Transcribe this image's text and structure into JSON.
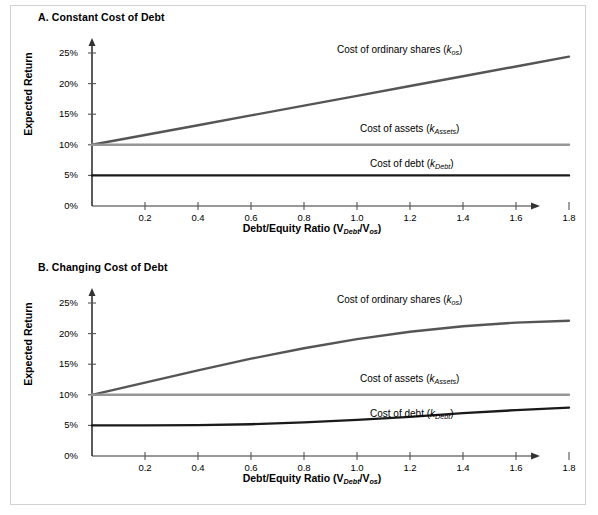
{
  "figure": {
    "background_color": "#ffffff",
    "border_color": "#d2d2d2",
    "width": 598,
    "height": 515
  },
  "panels": [
    {
      "id": "A",
      "title": "A. Constant Cost of Debt",
      "ylabel": "Expected Return",
      "xlabel_main": "Debt/Equity Ratio (V",
      "xlabel_sub1": "Debt",
      "xlabel_mid": "/V",
      "xlabel_sub2": "os",
      "xlabel_end": ")",
      "labels": {
        "kos_text": "Cost of ordinary shares (",
        "kos_k": "k",
        "kos_sub": "os",
        "kos_close": ")",
        "kassets_text": "Cost of assets (",
        "kassets_k": "k",
        "kassets_sub": "Assets",
        "kassets_close": ")",
        "kdebt_text": "Cost of debt (",
        "kdebt_k": "k",
        "kdebt_sub": "Debt",
        "kdebt_close": ")"
      }
    },
    {
      "id": "B",
      "title": "B. Changing Cost of Debt",
      "ylabel": "Expected Return",
      "xlabel_main": "Debt/Equity Ratio (V",
      "xlabel_sub1": "Debt",
      "xlabel_mid": "/V",
      "xlabel_sub2": "os",
      "xlabel_end": ")",
      "labels": {
        "kos_text": "Cost of ordinary shares (",
        "kos_k": "k",
        "kos_sub": "os",
        "kos_close": ")",
        "kassets_text": "Cost of assets (",
        "kassets_k": "k",
        "kassets_sub": "Assets",
        "kassets_close": ")",
        "kdebt_text": "Cost of debt (",
        "kdebt_k": "k",
        "kdebt_sub": "Debt",
        "kdebt_close": ")"
      }
    }
  ],
  "chart_data": [
    {
      "type": "line",
      "panel": "A",
      "title": "A. Constant Cost of Debt",
      "xlabel": "Debt/Equity Ratio (V_Debt/V_os)",
      "ylabel": "Expected Return",
      "xlim": [
        0,
        2.0
      ],
      "ylim": [
        0,
        27
      ],
      "xticks": [
        0.2,
        0.4,
        0.6,
        0.8,
        1.0,
        1.2,
        1.4,
        1.6,
        1.8
      ],
      "xtick_labels": [
        "0.2",
        "0.4",
        "0.6",
        "0.8",
        "1.0",
        "1.2",
        "1.4",
        "1.6",
        "1.8"
      ],
      "yticks": [
        0,
        5,
        10,
        15,
        20,
        25
      ],
      "ytick_labels": [
        "0%",
        "5%",
        "10%",
        "15%",
        "20%",
        "25%"
      ],
      "grid": false,
      "legend_position": "inline-annotations",
      "series": [
        {
          "name": "Cost of ordinary shares (k_os)",
          "color": "#555555",
          "x": [
            0,
            0.2,
            0.4,
            0.6,
            0.8,
            1.0,
            1.2,
            1.4,
            1.6,
            1.8
          ],
          "values": [
            10.0,
            11.6,
            13.2,
            14.8,
            16.4,
            18.0,
            19.6,
            21.2,
            22.8,
            24.4
          ]
        },
        {
          "name": "Cost of assets (k_Assets)",
          "color": "#969696",
          "x": [
            0,
            0.2,
            0.4,
            0.6,
            0.8,
            1.0,
            1.2,
            1.4,
            1.6,
            1.8
          ],
          "values": [
            10.0,
            10.0,
            10.0,
            10.0,
            10.0,
            10.0,
            10.0,
            10.0,
            10.0,
            10.0
          ]
        },
        {
          "name": "Cost of debt (k_Debt)",
          "color": "#1a1a1a",
          "x": [
            0,
            0.2,
            0.4,
            0.6,
            0.8,
            1.0,
            1.2,
            1.4,
            1.6,
            1.8
          ],
          "values": [
            5.0,
            5.0,
            5.0,
            5.0,
            5.0,
            5.0,
            5.0,
            5.0,
            5.0,
            5.0
          ]
        }
      ]
    },
    {
      "type": "line",
      "panel": "B",
      "title": "B. Changing Cost of Debt",
      "xlabel": "Debt/Equity Ratio (V_Debt/V_os)",
      "ylabel": "Expected Return",
      "xlim": [
        0,
        2.0
      ],
      "ylim": [
        0,
        27
      ],
      "xticks": [
        0.2,
        0.4,
        0.6,
        0.8,
        1.0,
        1.2,
        1.4,
        1.6,
        1.8
      ],
      "xtick_labels": [
        "0.2",
        "0.4",
        "0.6",
        "0.8",
        "1.0",
        "1.2",
        "1.4",
        "1.6",
        "1.8"
      ],
      "yticks": [
        0,
        5,
        10,
        15,
        20,
        25
      ],
      "ytick_labels": [
        "0%",
        "5%",
        "10%",
        "15%",
        "20%",
        "25%"
      ],
      "grid": false,
      "legend_position": "inline-annotations",
      "series": [
        {
          "name": "Cost of ordinary shares (k_os)",
          "color": "#555555",
          "x": [
            0,
            0.2,
            0.4,
            0.6,
            0.8,
            1.0,
            1.2,
            1.4,
            1.6,
            1.8
          ],
          "values": [
            10.0,
            12.0,
            14.0,
            15.9,
            17.6,
            19.1,
            20.3,
            21.2,
            21.8,
            22.1
          ]
        },
        {
          "name": "Cost of assets (k_Assets)",
          "color": "#969696",
          "x": [
            0,
            0.2,
            0.4,
            0.6,
            0.8,
            1.0,
            1.2,
            1.4,
            1.6,
            1.8
          ],
          "values": [
            10.0,
            10.0,
            10.0,
            10.0,
            10.0,
            10.0,
            10.0,
            10.0,
            10.0,
            10.0
          ]
        },
        {
          "name": "Cost of debt (k_Debt)",
          "color": "#1a1a1a",
          "x": [
            0,
            0.2,
            0.4,
            0.6,
            0.8,
            1.0,
            1.2,
            1.4,
            1.6,
            1.8
          ],
          "values": [
            5.0,
            5.0,
            5.05,
            5.2,
            5.5,
            5.9,
            6.4,
            7.0,
            7.5,
            7.9
          ]
        }
      ]
    }
  ]
}
